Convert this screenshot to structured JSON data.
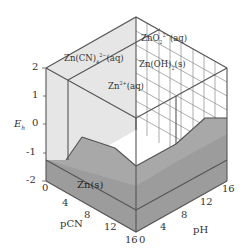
{
  "figure": {
    "type": "3d-potential-pH-pCN-diagram",
    "axes": {
      "z": {
        "label": "E",
        "subscript": "h",
        "ticks": [
          "2",
          "1",
          "0",
          "-1",
          "-2"
        ],
        "range": [
          -2,
          2
        ]
      },
      "pCN": {
        "label": "pCN",
        "ticks": [
          "0",
          "4",
          "8",
          "12",
          "16"
        ],
        "range": [
          0,
          16
        ]
      },
      "pH": {
        "label": "pH",
        "ticks": [
          "0",
          "4",
          "8",
          "12",
          "16"
        ],
        "range": [
          0,
          16
        ]
      }
    },
    "species": [
      {
        "id": "zn-cn4",
        "label": "Zn(CN)",
        "sub": "4",
        "sup": "2−",
        "phase": "(aq)"
      },
      {
        "id": "zno2",
        "label": "ZnO",
        "sub": "2",
        "sup": "2−",
        "phase": "(aq)"
      },
      {
        "id": "zn-oh2",
        "label": "Zn(OH)",
        "sub": "2",
        "sup": "",
        "phase": "(s)"
      },
      {
        "id": "zn2",
        "label": "Zn",
        "sub": "",
        "sup": "2+",
        "phase": "(aq)"
      },
      {
        "id": "zn-s",
        "label": "Zn",
        "sub": "",
        "sup": "",
        "phase": "(s)"
      }
    ],
    "colors": {
      "floor": "#9a9a9a",
      "left_wall": "#e4e4e4",
      "right_wall": "#ffffff",
      "edge": "#555555",
      "grid": "#7a7a7a"
    }
  }
}
